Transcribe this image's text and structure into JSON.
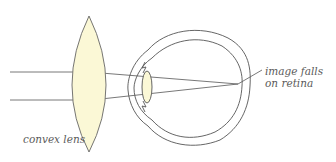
{
  "diagram": {
    "type": "optics-eye-correction",
    "labels": {
      "lens": "convex lens",
      "retina_line1": "image falls",
      "retina_line2": "on retina"
    },
    "colors": {
      "lens_fill": "#fbf8d6",
      "stroke": "#555555",
      "background": "#ffffff"
    },
    "elements": [
      "incoming parallel light rays (2)",
      "convex lens",
      "eye (cornea, iris, lens, sclera, retina)",
      "rays converging at focal point on retina",
      "leader line to label"
    ]
  }
}
